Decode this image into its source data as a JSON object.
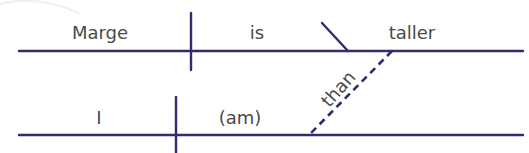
{
  "diagram": {
    "type": "sentence-diagram",
    "sentence": "Marge is taller than I (am).",
    "colors": {
      "line": "#2f2c70",
      "text": "#4a4a4a",
      "background": "#ffffff"
    },
    "main_clause": {
      "subject": "Marge",
      "verb": "is",
      "predicate_adjective": "taller"
    },
    "connector": {
      "word": "than",
      "style": "dashed"
    },
    "subordinate_clause": {
      "subject": "I",
      "verb": "(am)"
    }
  }
}
